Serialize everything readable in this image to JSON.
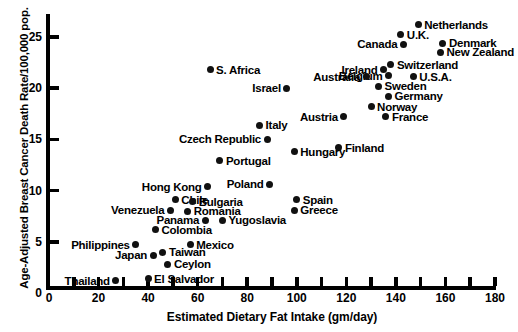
{
  "chart_data": {
    "type": "scatter",
    "title": "",
    "xlabel": "Estimated Dietary Fat Intake (gm/day)",
    "ylabel": "Age-Adjusted Breast Cancer Death Rate/100,000 pop.",
    "xlim": [
      0,
      180
    ],
    "ylim": [
      0,
      27
    ],
    "grid": false,
    "legend": "none",
    "xticks": [
      0,
      10,
      20,
      30,
      40,
      50,
      60,
      70,
      80,
      90,
      100,
      110,
      120,
      130,
      140,
      150,
      160,
      170,
      180
    ],
    "xtick_labels": [
      "0",
      "",
      "20",
      "",
      "40",
      "",
      "60",
      "",
      "80",
      "",
      "100",
      "",
      "120",
      "",
      "140",
      "",
      "160",
      "",
      "180"
    ],
    "yticks": [
      0,
      5,
      10,
      15,
      20,
      25
    ],
    "ytick_labels": [
      "0",
      "5",
      "10",
      "15",
      "20",
      "25"
    ],
    "points": [
      {
        "label": "Netherlands",
        "x": 149,
        "y": 26.2,
        "side": "right"
      },
      {
        "label": "U.K.",
        "x": 142,
        "y": 25.2,
        "side": "right"
      },
      {
        "label": "Canada",
        "x": 143,
        "y": 24.3,
        "side": "left"
      },
      {
        "label": "Denmark",
        "x": 159,
        "y": 24.4,
        "side": "right"
      },
      {
        "label": "New Zealand",
        "x": 158,
        "y": 23.5,
        "side": "right"
      },
      {
        "label": "Switzerland",
        "x": 138,
        "y": 22.3,
        "side": "right"
      },
      {
        "label": "Ireland",
        "x": 135,
        "y": 21.8,
        "side": "left"
      },
      {
        "label": "U.S.A.",
        "x": 147,
        "y": 21.1,
        "side": "right"
      },
      {
        "label": "Belgium",
        "x": 137,
        "y": 21.2,
        "side": "left"
      },
      {
        "label": "Australia",
        "x": 128,
        "y": 21.1,
        "side": "left"
      },
      {
        "label": "Sweden",
        "x": 133,
        "y": 20.2,
        "side": "right"
      },
      {
        "label": "Germany",
        "x": 137,
        "y": 19.2,
        "side": "right"
      },
      {
        "label": "Norway",
        "x": 130,
        "y": 18.2,
        "side": "right"
      },
      {
        "label": "Austria",
        "x": 119,
        "y": 17.2,
        "side": "left"
      },
      {
        "label": "France",
        "x": 136,
        "y": 17.2,
        "side": "right"
      },
      {
        "label": "S. Africa",
        "x": 65,
        "y": 21.8,
        "side": "right"
      },
      {
        "label": "Israel",
        "x": 96,
        "y": 20.0,
        "side": "left"
      },
      {
        "label": "Italy",
        "x": 85,
        "y": 16.4,
        "side": "right"
      },
      {
        "label": "Czech Republic",
        "x": 88,
        "y": 15.0,
        "side": "left"
      },
      {
        "label": "Finland",
        "x": 117,
        "y": 14.2,
        "side": "right"
      },
      {
        "label": "Hungary",
        "x": 99,
        "y": 13.8,
        "side": "right"
      },
      {
        "label": "Portugal",
        "x": 69,
        "y": 12.9,
        "side": "right"
      },
      {
        "label": "Poland",
        "x": 89,
        "y": 10.6,
        "side": "left"
      },
      {
        "label": "Hong Kong",
        "x": 64,
        "y": 10.4,
        "side": "left"
      },
      {
        "label": "Chile",
        "x": 51,
        "y": 9.1,
        "side": "right"
      },
      {
        "label": "Spain",
        "x": 100,
        "y": 9.1,
        "side": "right"
      },
      {
        "label": "Bulgaria",
        "x": 58,
        "y": 8.9,
        "side": "right"
      },
      {
        "label": "Greece",
        "x": 99,
        "y": 8.1,
        "side": "right"
      },
      {
        "label": "Venezuela",
        "x": 49,
        "y": 8.1,
        "side": "left"
      },
      {
        "label": "Romania",
        "x": 56,
        "y": 8.0,
        "side": "right"
      },
      {
        "label": "Panama",
        "x": 63,
        "y": 7.1,
        "side": "left"
      },
      {
        "label": "Yugoslavia",
        "x": 70,
        "y": 7.1,
        "side": "right"
      },
      {
        "label": "Colombia",
        "x": 43,
        "y": 6.2,
        "side": "right"
      },
      {
        "label": "Philippines",
        "x": 35,
        "y": 4.7,
        "side": "left"
      },
      {
        "label": "Mexico",
        "x": 57,
        "y": 4.7,
        "side": "right"
      },
      {
        "label": "Japan",
        "x": 42,
        "y": 3.7,
        "side": "left"
      },
      {
        "label": "Taiwan",
        "x": 46,
        "y": 4.0,
        "side": "right"
      },
      {
        "label": "Ceylon",
        "x": 48,
        "y": 2.8,
        "side": "right"
      },
      {
        "label": "Thailand",
        "x": 27,
        "y": 1.2,
        "side": "left"
      },
      {
        "label": "El Salvador",
        "x": 40,
        "y": 1.4,
        "side": "right"
      }
    ]
  }
}
